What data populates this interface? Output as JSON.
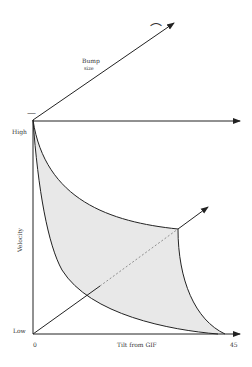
{
  "diagram": {
    "labels": {
      "bump_size_line1": "Bump",
      "bump_size_line2": "size",
      "high": "High",
      "low": "Low",
      "velocity": "Velocity",
      "x_axis_title": "Tilt from GIF",
      "x_min": "0",
      "x_max": "45"
    },
    "symbols": {
      "small_bump": "⌒",
      "flat_bump": "—"
    },
    "colors": {
      "line": "#222222",
      "fill": "#e6e6e6",
      "text": "#333333"
    }
  }
}
